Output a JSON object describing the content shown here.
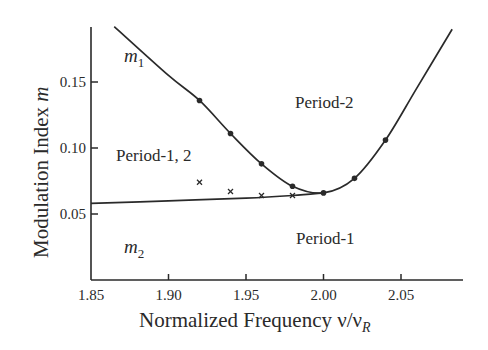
{
  "chart_data": {
    "type": "line",
    "title": "",
    "xlabel": "Normalized Frequency ν/ν_R",
    "ylabel": "Modulation Index m",
    "xlim": [
      1.85,
      2.09
    ],
    "ylim": [
      0.0,
      0.19
    ],
    "xticks": [
      "1.85",
      "1.90",
      "1.95",
      "2.00",
      "2.05"
    ],
    "yticks": [
      "0.05",
      "0.10",
      "0.15"
    ],
    "grid": false,
    "legend": null,
    "series": [
      {
        "name": "m1",
        "marker": "dot",
        "curve": [
          [
            1.865,
            0.192
          ],
          [
            1.9,
            0.155
          ],
          [
            1.92,
            0.136
          ],
          [
            1.94,
            0.111
          ],
          [
            1.96,
            0.088
          ],
          [
            1.98,
            0.071
          ],
          [
            2.0,
            0.066
          ],
          [
            2.02,
            0.077
          ],
          [
            2.04,
            0.106
          ],
          [
            2.06,
            0.145
          ],
          [
            2.083,
            0.19
          ]
        ],
        "points": [
          [
            1.92,
            0.136
          ],
          [
            1.94,
            0.111
          ],
          [
            1.96,
            0.088
          ],
          [
            1.98,
            0.071
          ],
          [
            2.0,
            0.066
          ],
          [
            2.02,
            0.077
          ],
          [
            2.04,
            0.106
          ]
        ]
      },
      {
        "name": "m2",
        "marker": "cross",
        "curve": [
          [
            1.85,
            0.058
          ],
          [
            1.9,
            0.06
          ],
          [
            1.95,
            0.062
          ],
          [
            1.98,
            0.064
          ],
          [
            2.0,
            0.066
          ]
        ],
        "points": [
          [
            1.92,
            0.074
          ],
          [
            1.94,
            0.067
          ],
          [
            1.96,
            0.064
          ],
          [
            1.98,
            0.064
          ]
        ]
      }
    ],
    "annotations": [
      {
        "text": "m1",
        "x": 1.874,
        "y": 0.178
      },
      {
        "text": "m2",
        "x": 1.876,
        "y": 0.043
      },
      {
        "text": "Period-2",
        "x": 2.0,
        "y": 0.13
      },
      {
        "text": "Period-1, 2",
        "x": 1.865,
        "y": 0.092
      },
      {
        "text": "Period-1",
        "x": 2.0,
        "y": 0.038
      }
    ]
  },
  "labels": {
    "ylabel": "Modulation Index ",
    "ylabel_var": "m",
    "xlabel": "Normalized Frequency ν/ν",
    "xlabel_sub": "R",
    "m1": "m",
    "m1_sub": "1",
    "m2": "m",
    "m2_sub": "2",
    "period2": "Period-2",
    "period12": "Period-1, 2",
    "period1": "Period-1"
  }
}
